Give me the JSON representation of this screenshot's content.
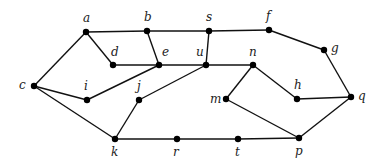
{
  "diagram": {
    "type": "undirected-graph",
    "nodes": [
      {
        "id": "a",
        "label": "a",
        "x": 86,
        "y": 32,
        "lx": 83,
        "ly": 22
      },
      {
        "id": "b",
        "label": "b",
        "x": 147,
        "y": 31,
        "lx": 144,
        "ly": 21
      },
      {
        "id": "s",
        "label": "s",
        "x": 209,
        "y": 31,
        "lx": 206,
        "ly": 21
      },
      {
        "id": "f",
        "label": "f",
        "x": 269,
        "y": 30,
        "lx": 266,
        "ly": 20
      },
      {
        "id": "g",
        "label": "g",
        "x": 324,
        "y": 50,
        "lx": 331,
        "ly": 52
      },
      {
        "id": "d",
        "label": "d",
        "x": 113,
        "y": 65,
        "lx": 111,
        "ly": 56
      },
      {
        "id": "e",
        "label": "e",
        "x": 159,
        "y": 65,
        "lx": 162,
        "ly": 56
      },
      {
        "id": "u",
        "label": "u",
        "x": 206,
        "y": 65,
        "lx": 196,
        "ly": 56
      },
      {
        "id": "n",
        "label": "n",
        "x": 253,
        "y": 65,
        "lx": 249,
        "ly": 56
      },
      {
        "id": "c",
        "label": "c",
        "x": 34,
        "y": 86,
        "lx": 19,
        "ly": 89
      },
      {
        "id": "i",
        "label": "i",
        "x": 87,
        "y": 100,
        "lx": 84,
        "ly": 90
      },
      {
        "id": "j",
        "label": "j",
        "x": 139,
        "y": 100,
        "lx": 137,
        "ly": 90
      },
      {
        "id": "m",
        "label": "m",
        "x": 226,
        "y": 99,
        "lx": 210,
        "ly": 103
      },
      {
        "id": "h",
        "label": "h",
        "x": 297,
        "y": 99,
        "lx": 294,
        "ly": 89
      },
      {
        "id": "q",
        "label": "q",
        "x": 351,
        "y": 97,
        "lx": 358,
        "ly": 100
      },
      {
        "id": "k",
        "label": "k",
        "x": 115,
        "y": 139,
        "lx": 111,
        "ly": 156
      },
      {
        "id": "r",
        "label": "r",
        "x": 177,
        "y": 139,
        "lx": 173,
        "ly": 156
      },
      {
        "id": "t",
        "label": "t",
        "x": 238,
        "y": 139,
        "lx": 235,
        "ly": 156
      },
      {
        "id": "p",
        "label": "p",
        "x": 299,
        "y": 138,
        "lx": 295,
        "ly": 155
      }
    ],
    "edges": [
      [
        "a",
        "b"
      ],
      [
        "b",
        "s"
      ],
      [
        "s",
        "f"
      ],
      [
        "f",
        "g"
      ],
      [
        "g",
        "q"
      ],
      [
        "a",
        "d"
      ],
      [
        "a",
        "c"
      ],
      [
        "b",
        "e"
      ],
      [
        "d",
        "e"
      ],
      [
        "e",
        "u"
      ],
      [
        "u",
        "n"
      ],
      [
        "s",
        "u"
      ],
      [
        "c",
        "i"
      ],
      [
        "i",
        "e"
      ],
      [
        "c",
        "k"
      ],
      [
        "k",
        "j"
      ],
      [
        "j",
        "u"
      ],
      [
        "k",
        "r"
      ],
      [
        "r",
        "t"
      ],
      [
        "t",
        "p"
      ],
      [
        "n",
        "m"
      ],
      [
        "n",
        "h"
      ],
      [
        "m",
        "p"
      ],
      [
        "h",
        "q"
      ],
      [
        "q",
        "p"
      ]
    ]
  }
}
